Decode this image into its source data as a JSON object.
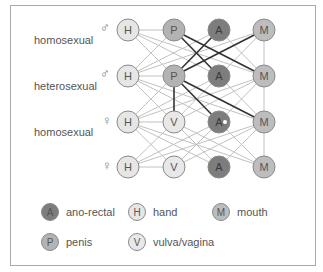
{
  "row_labels": [
    {
      "text": "homosexual",
      "x": 34,
      "y": 41
    },
    {
      "text": "heterosexual",
      "x": 34,
      "y": 88
    },
    {
      "text": "homosexual",
      "x": 34,
      "y": 134
    }
  ],
  "sex_symbols": [
    {
      "row": 0,
      "symbol": "♂",
      "icon": "male-symbol-icon"
    },
    {
      "row": 1,
      "symbol": "♂",
      "icon": "male-symbol-icon"
    },
    {
      "row": 2,
      "symbol": "♀",
      "icon": "female-symbol-icon"
    },
    {
      "row": 3,
      "symbol": "♀",
      "icon": "female-symbol-icon"
    }
  ],
  "colors": {
    "hand": "#e6e6e6",
    "penis": "#b3b3b3",
    "vulva": "#e8e8e8",
    "anal": "#7d7d7d",
    "mouth": "#bdbdbd",
    "light_edge": "#c2c2c2",
    "dark_edge": "#333333",
    "node_stroke": "#8a8a8a"
  },
  "rows": [
    {
      "y": 30,
      "nodes": [
        "H",
        "P",
        "A",
        "M"
      ]
    },
    {
      "y": 76,
      "nodes": [
        "H",
        "P",
        "A",
        "M"
      ]
    },
    {
      "y": 122,
      "nodes": [
        "H",
        "V",
        "A",
        "M"
      ]
    },
    {
      "y": 167,
      "nodes": [
        "H",
        "V",
        "A",
        "M"
      ]
    }
  ],
  "column_x": [
    128,
    174,
    219,
    264
  ],
  "dark_edges": [
    [
      [
        0,
        1
      ],
      [
        1,
        2
      ]
    ],
    [
      [
        0,
        1
      ],
      [
        1,
        3
      ]
    ],
    [
      [
        0,
        2
      ],
      [
        1,
        1
      ]
    ],
    [
      [
        0,
        3
      ],
      [
        1,
        1
      ]
    ],
    [
      [
        1,
        1
      ],
      [
        2,
        1
      ]
    ],
    [
      [
        1,
        1
      ],
      [
        2,
        2
      ]
    ],
    [
      [
        1,
        1
      ],
      [
        2,
        3
      ]
    ]
  ],
  "legend": [
    {
      "letter": "A",
      "label": "ano-rectal",
      "type": "anal"
    },
    {
      "letter": "H",
      "label": "hand",
      "type": "hand"
    },
    {
      "letter": "M",
      "label": "mouth",
      "type": "mouth"
    },
    {
      "letter": "P",
      "label": "penis",
      "type": "penis"
    },
    {
      "letter": "V",
      "label": "vulva/vagina",
      "type": "vulva"
    }
  ],
  "chart_data": {
    "type": "network",
    "title": "",
    "rows": [
      {
        "sex": "male",
        "nodes": [
          "H",
          "P",
          "A",
          "M"
        ]
      },
      {
        "sex": "male",
        "nodes": [
          "H",
          "P",
          "A",
          "M"
        ]
      },
      {
        "sex": "female",
        "nodes": [
          "H",
          "V",
          "A",
          "M"
        ]
      },
      {
        "sex": "female",
        "nodes": [
          "H",
          "V",
          "A",
          "M"
        ]
      }
    ],
    "row_group_labels": [
      "homosexual",
      "heterosexual",
      "homosexual"
    ],
    "highlighted_edges": [
      "r1:P-r2:A",
      "r1:P-r2:M",
      "r1:A-r2:P",
      "r1:M-r2:P",
      "r2:P-r3:V",
      "r2:P-r3:A",
      "r2:P-r3:M"
    ],
    "legend": {
      "A": "ano-rectal",
      "H": "hand",
      "M": "mouth",
      "P": "penis",
      "V": "vulva/vagina"
    }
  }
}
